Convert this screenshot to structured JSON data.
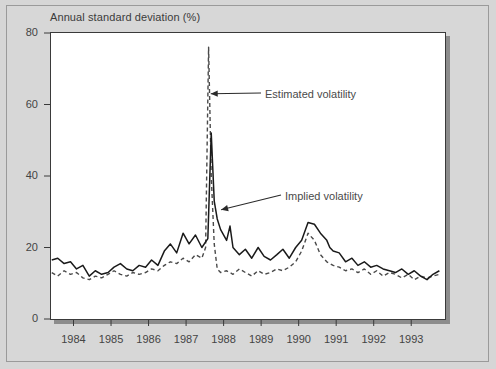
{
  "chart_data": {
    "type": "line",
    "title": "Annual standard deviation (%)",
    "xlabel": "",
    "ylabel": "Annual standard deviation (%)",
    "ylim": [
      0,
      80
    ],
    "yticks": [
      0,
      20,
      40,
      60,
      80
    ],
    "xlim": [
      1983.4,
      1993.9
    ],
    "xticks": [
      1984,
      1985,
      1986,
      1987,
      1988,
      1989,
      1990,
      1991,
      1992,
      1993
    ],
    "xtick_labels": [
      "1984",
      "1985",
      "1986",
      "1987",
      "1988",
      "1989",
      "1990",
      "1991",
      "1992",
      "1993"
    ],
    "grid": false,
    "legend_position": "none",
    "annotations": [
      {
        "text": "Estimated volatility",
        "target_series": "Estimated volatility",
        "x": 1987.55,
        "y": 63
      },
      {
        "text": "Implied volatility",
        "target_series": "Implied volatility",
        "x": 1988.2,
        "y": 30
      }
    ],
    "series": [
      {
        "name": "Implied volatility",
        "style": "solid",
        "color": "#1a1a1a",
        "x": [
          1983.42,
          1983.58,
          1983.75,
          1983.92,
          1984.08,
          1984.25,
          1984.42,
          1984.58,
          1984.75,
          1984.92,
          1985.08,
          1985.25,
          1985.42,
          1985.58,
          1985.75,
          1985.92,
          1986.08,
          1986.25,
          1986.42,
          1986.58,
          1986.75,
          1986.92,
          1987.08,
          1987.25,
          1987.42,
          1987.58,
          1987.67,
          1987.75,
          1987.83,
          1987.92,
          1988.08,
          1988.17,
          1988.25,
          1988.42,
          1988.58,
          1988.75,
          1988.92,
          1989.08,
          1989.25,
          1989.42,
          1989.58,
          1989.75,
          1989.92,
          1990.08,
          1990.25,
          1990.42,
          1990.58,
          1990.75,
          1990.83,
          1990.92,
          1991.08,
          1991.25,
          1991.42,
          1991.58,
          1991.75,
          1991.92,
          1992.08,
          1992.25,
          1992.42,
          1992.58,
          1992.75,
          1992.92,
          1993.08,
          1993.25,
          1993.42,
          1993.58,
          1993.75
        ],
        "y": [
          16.5,
          17.0,
          15.5,
          16.0,
          14.0,
          15.0,
          12.0,
          13.5,
          12.5,
          13.0,
          14.5,
          15.5,
          14.0,
          13.5,
          15.0,
          14.5,
          16.5,
          15.0,
          19.0,
          21.0,
          18.5,
          24.0,
          21.0,
          23.5,
          20.0,
          22.5,
          52.0,
          33.0,
          28.0,
          25.0,
          22.0,
          26.0,
          20.0,
          18.0,
          19.5,
          17.0,
          20.0,
          17.5,
          16.5,
          18.0,
          19.5,
          17.0,
          20.0,
          22.0,
          27.0,
          26.5,
          24.0,
          22.0,
          20.0,
          19.0,
          18.5,
          16.0,
          17.0,
          15.0,
          16.0,
          14.5,
          15.0,
          14.0,
          13.5,
          13.0,
          14.0,
          12.5,
          13.5,
          12.0,
          11.0,
          12.5,
          13.5
        ]
      },
      {
        "name": "Estimated volatility",
        "style": "dashed",
        "color": "#4a4a4a",
        "x": [
          1983.42,
          1983.58,
          1983.75,
          1983.92,
          1984.08,
          1984.25,
          1984.42,
          1984.58,
          1984.75,
          1984.92,
          1985.08,
          1985.25,
          1985.42,
          1985.58,
          1985.75,
          1985.92,
          1986.08,
          1986.25,
          1986.42,
          1986.58,
          1986.75,
          1986.92,
          1987.08,
          1987.25,
          1987.42,
          1987.52,
          1987.6,
          1987.67,
          1987.75,
          1987.83,
          1987.92,
          1988.08,
          1988.25,
          1988.42,
          1988.58,
          1988.75,
          1988.92,
          1989.08,
          1989.25,
          1989.42,
          1989.58,
          1989.75,
          1989.92,
          1990.08,
          1990.25,
          1990.42,
          1990.58,
          1990.75,
          1990.92,
          1991.08,
          1991.25,
          1991.42,
          1991.58,
          1991.75,
          1991.92,
          1992.08,
          1992.25,
          1992.42,
          1992.58,
          1992.75,
          1992.92,
          1993.08,
          1993.25,
          1993.42,
          1993.58,
          1993.75
        ],
        "y": [
          13.0,
          12.0,
          13.5,
          12.5,
          13.0,
          11.5,
          11.0,
          12.0,
          11.5,
          12.5,
          13.5,
          12.5,
          12.0,
          13.0,
          12.5,
          13.0,
          14.0,
          13.5,
          15.0,
          16.0,
          15.5,
          17.0,
          16.0,
          18.0,
          17.0,
          20.0,
          76.0,
          40.0,
          21.0,
          14.0,
          13.0,
          13.5,
          12.5,
          14.0,
          13.0,
          12.0,
          13.5,
          12.5,
          13.0,
          14.0,
          13.5,
          14.5,
          16.0,
          19.0,
          24.0,
          22.0,
          18.0,
          16.0,
          15.0,
          14.5,
          13.5,
          14.0,
          13.0,
          14.0,
          12.5,
          13.5,
          12.0,
          13.0,
          12.5,
          11.5,
          12.5,
          11.0,
          12.0,
          11.5,
          12.0,
          12.5
        ]
      }
    ]
  }
}
